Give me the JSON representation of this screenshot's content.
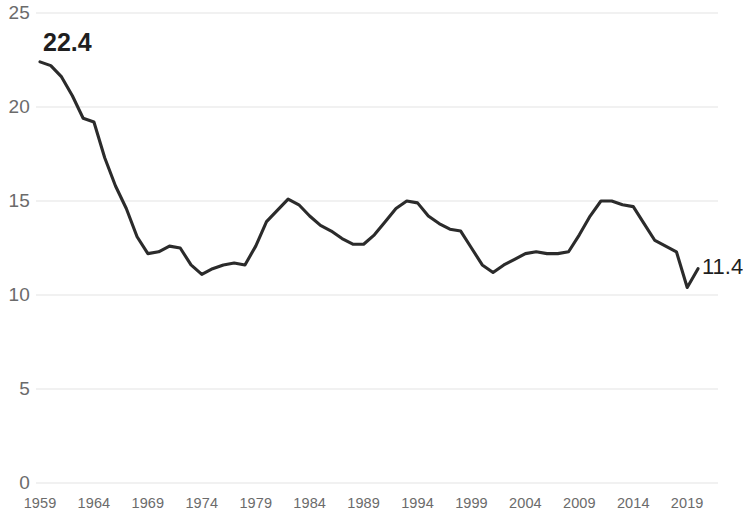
{
  "chart_data": {
    "type": "line",
    "title": "",
    "subtitle": "",
    "xlabel": "",
    "ylabel": "",
    "xlim": [
      1959,
      2020
    ],
    "ylim": [
      0,
      25
    ],
    "grid": true,
    "legend": false,
    "legend_position": "none",
    "line_color": "#2b2b2b",
    "grid_color": "#e3e3e3",
    "tick_label_color": "#6b6b6b",
    "y_ticks": [
      "0",
      "5",
      "10",
      "15",
      "20",
      "25"
    ],
    "y_tick_values": [
      0,
      5,
      10,
      15,
      20,
      25
    ],
    "x_ticks": [
      "1959",
      "1964",
      "1969",
      "1974",
      "1979",
      "1984",
      "1989",
      "1994",
      "1999",
      "2004",
      "2009",
      "2014",
      "2019"
    ],
    "x_tick_values": [
      1959,
      1964,
      1969,
      1974,
      1979,
      1984,
      1989,
      1994,
      1999,
      2004,
      2009,
      2014,
      2019
    ],
    "annotations": [
      {
        "name": "start-value",
        "text": "22.4",
        "x": 1959,
        "y": 22.4
      },
      {
        "name": "end-value",
        "text": "11.4",
        "x": 2020,
        "y": 11.4
      }
    ],
    "series": [
      {
        "name": "rate",
        "x": [
          1959,
          1960,
          1961,
          1962,
          1963,
          1964,
          1965,
          1966,
          1967,
          1968,
          1969,
          1970,
          1971,
          1972,
          1973,
          1974,
          1975,
          1976,
          1977,
          1978,
          1979,
          1980,
          1981,
          1982,
          1983,
          1984,
          1985,
          1986,
          1987,
          1988,
          1989,
          1990,
          1991,
          1992,
          1993,
          1994,
          1995,
          1996,
          1997,
          1998,
          1999,
          2000,
          2001,
          2002,
          2003,
          2004,
          2005,
          2006,
          2007,
          2008,
          2009,
          2010,
          2011,
          2012,
          2013,
          2014,
          2015,
          2016,
          2017,
          2018,
          2019,
          2020
        ],
        "values": [
          22.4,
          22.2,
          21.6,
          20.6,
          19.4,
          19.2,
          17.3,
          15.8,
          14.6,
          13.1,
          12.2,
          12.3,
          12.6,
          12.5,
          11.6,
          11.1,
          11.4,
          11.6,
          11.7,
          11.6,
          12.6,
          13.9,
          14.5,
          15.1,
          14.8,
          14.2,
          13.7,
          13.4,
          13.0,
          12.7,
          12.7,
          13.2,
          13.9,
          14.6,
          15.0,
          14.9,
          14.2,
          13.8,
          13.5,
          13.4,
          12.5,
          11.6,
          11.2,
          11.6,
          11.9,
          12.2,
          12.3,
          12.2,
          12.2,
          12.3,
          13.2,
          14.2,
          15.0,
          15.0,
          14.8,
          14.7,
          13.8,
          12.9,
          12.6,
          12.3,
          10.4,
          11.4
        ]
      }
    ]
  }
}
